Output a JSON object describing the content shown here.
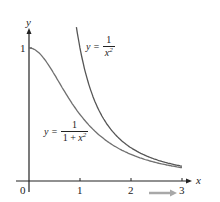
{
  "chart_data": {
    "type": "line",
    "title": "",
    "xlabel": "x",
    "ylabel": "y",
    "xlim": [
      0,
      3
    ],
    "ylim": [
      0,
      1.15
    ],
    "grid": false,
    "legend": "inline labels",
    "x_ticks": [
      "0",
      "1",
      "2",
      "3"
    ],
    "y_ticks": [
      "1"
    ],
    "series": [
      {
        "name": "y = 1/x^2",
        "label_parts": {
          "lhs": "y =",
          "num": "1",
          "den": "x",
          "exp": "2"
        },
        "x": [
          0.93,
          1.0,
          1.25,
          1.5,
          1.75,
          2.0,
          2.5,
          3.0
        ],
        "y": [
          1.156,
          1.0,
          0.64,
          0.444,
          0.327,
          0.25,
          0.16,
          0.111
        ],
        "color": "#555555"
      },
      {
        "name": "y = 1/(1 + x^2)",
        "label_parts": {
          "lhs": "y =",
          "num": "1",
          "den_pre": "1 + ",
          "den": "x",
          "exp": "2"
        },
        "x": [
          0,
          0.25,
          0.5,
          0.75,
          1.0,
          1.5,
          2.0,
          2.5,
          3.0
        ],
        "y": [
          1.0,
          0.941,
          0.8,
          0.64,
          0.5,
          0.308,
          0.2,
          0.138,
          0.1
        ],
        "color": "#707070"
      }
    ],
    "annotations": [
      "gray arrow pointing right below x-axis near x=2.5"
    ]
  },
  "axes": {
    "x_label": "x",
    "y_label": "y",
    "origin_label": "0",
    "x_tick_labels": [
      "1",
      "2",
      "3"
    ],
    "y_tick_labels": [
      "1"
    ]
  },
  "labels": {
    "curve1": {
      "lhs": "y =",
      "num": "1",
      "den": "x",
      "exp": "2"
    },
    "curve2": {
      "lhs": "y =",
      "num": "1",
      "den_pre": "1 + ",
      "den": "x",
      "exp": "2"
    }
  },
  "colors": {
    "axis": "#222222",
    "curve1": "#555555",
    "curve2": "#707070",
    "arrow": "#a8a8a8"
  }
}
